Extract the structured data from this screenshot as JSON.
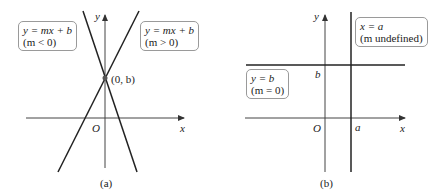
{
  "panels": [
    {
      "id": "a",
      "caption": "(a)",
      "axes": {
        "x_label": "x",
        "y_label": "y",
        "origin_label": "O"
      },
      "point_label": "(0, b)",
      "lines": [
        {
          "box_line1": "y = mx + b",
          "box_line2": "(m < 0)",
          "slope_sign": "negative"
        },
        {
          "box_line1": "y = mx + b",
          "box_line2": "(m > 0)",
          "slope_sign": "positive"
        }
      ]
    },
    {
      "id": "b",
      "caption": "(b)",
      "axes": {
        "x_label": "x",
        "y_label": "y",
        "origin_label": "O"
      },
      "intercept_labels": {
        "b": "b",
        "a": "a"
      },
      "lines": [
        {
          "box_line1": "x = a",
          "box_line2": "(m undefined)",
          "orientation": "vertical"
        },
        {
          "box_line1": "y = b",
          "box_line2": "(m = 0)",
          "orientation": "horizontal"
        }
      ]
    }
  ]
}
